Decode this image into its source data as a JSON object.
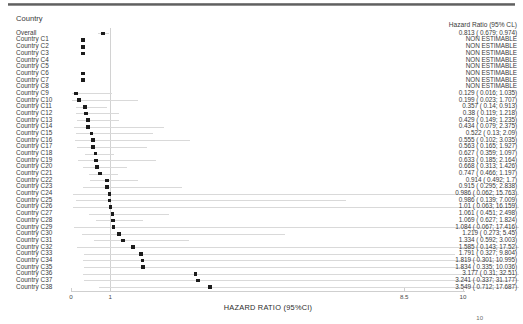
{
  "header": {
    "country_label": "Country",
    "hazard_ratio_label": "Hazard Ratio (95% CL)"
  },
  "axis": {
    "title": "HAZARD RATIO (95%CI)",
    "ticks": [
      {
        "label": "0",
        "value": 0
      },
      {
        "label": "1",
        "value": 1
      },
      {
        "label": "8.5",
        "value": 8.5
      },
      {
        "label": "10",
        "value": 10
      }
    ],
    "reference_value": 1,
    "xmin": 0,
    "xmax": 10
  },
  "page_number": "10",
  "colors": {
    "marker": "#1c1c1c",
    "ci_line": "#d9d9d9",
    "reference_line": "#d2d2d2",
    "axis": "#cfcfcf",
    "text": "#3a3a3a"
  },
  "chart_data": {
    "type": "forest",
    "title": "",
    "xlabel": "HAZARD RATIO (95%CI)",
    "ylabel": "Country",
    "xlim": [
      0,
      10
    ],
    "reference_line": 1,
    "grid": false,
    "legend": "none",
    "columns": [
      "Country",
      "Hazard Ratio (95% CL)"
    ],
    "rows": [
      {
        "label": "Overall",
        "stat": "0.813 ( 0.679; 0.974)",
        "estimate": 0.813,
        "lower": 0.679,
        "upper": 0.974,
        "estimable": true
      },
      {
        "label": "Country C1",
        "stat": "NON ESTIMABLE",
        "estimate": 0.3,
        "lower": null,
        "upper": null,
        "estimable": false
      },
      {
        "label": "Country C2",
        "stat": "NON ESTIMABLE",
        "estimate": 0.3,
        "lower": null,
        "upper": null,
        "estimable": false
      },
      {
        "label": "Country C3",
        "stat": "NON ESTIMABLE",
        "estimate": 0.3,
        "lower": null,
        "upper": null,
        "estimable": false
      },
      {
        "label": "Country C4",
        "stat": "NON ESTIMABLE",
        "estimate": null,
        "lower": null,
        "upper": null,
        "estimable": false
      },
      {
        "label": "Country C5",
        "stat": "NON ESTIMABLE",
        "estimate": null,
        "lower": null,
        "upper": null,
        "estimable": false
      },
      {
        "label": "Country C6",
        "stat": "NON ESTIMABLE",
        "estimate": 0.3,
        "lower": null,
        "upper": null,
        "estimable": false
      },
      {
        "label": "Country C7",
        "stat": "NON ESTIMABLE",
        "estimate": 0.3,
        "lower": null,
        "upper": null,
        "estimable": false
      },
      {
        "label": "Country C8",
        "stat": "NON ESTIMABLE",
        "estimate": null,
        "lower": null,
        "upper": null,
        "estimable": false
      },
      {
        "label": "Country C9",
        "stat": "0.129 ( 0.016; 1.035)",
        "estimate": 0.129,
        "lower": 0.016,
        "upper": 1.035,
        "estimable": true
      },
      {
        "label": "Country C10",
        "stat": "0.199 ( 0.023; 1.707)",
        "estimate": 0.199,
        "lower": 0.023,
        "upper": 1.707,
        "estimable": true
      },
      {
        "label": "Country C11",
        "stat": "0.357 ( 0.14; 0.913)",
        "estimate": 0.357,
        "lower": 0.14,
        "upper": 0.913,
        "estimable": true
      },
      {
        "label": "Country C12",
        "stat": "0.38 ( 0.119; 1.218)",
        "estimate": 0.38,
        "lower": 0.119,
        "upper": 1.218,
        "estimable": true
      },
      {
        "label": "Country C13",
        "stat": "0.429 ( 0.149; 1.235)",
        "estimate": 0.429,
        "lower": 0.149,
        "upper": 1.235,
        "estimable": true
      },
      {
        "label": "Country C14",
        "stat": "0.434 ( 0.079; 2.375)",
        "estimate": 0.434,
        "lower": 0.079,
        "upper": 2.375,
        "estimable": true
      },
      {
        "label": "Country C15",
        "stat": "0.522 ( 0.13; 2.09)",
        "estimate": 0.522,
        "lower": 0.13,
        "upper": 2.09,
        "estimable": true
      },
      {
        "label": "Country C16",
        "stat": "0.555 ( 0.102; 3.035)",
        "estimate": 0.555,
        "lower": 0.102,
        "upper": 3.035,
        "estimable": true
      },
      {
        "label": "Country C17",
        "stat": "0.563 ( 0.165; 1.927)",
        "estimate": 0.563,
        "lower": 0.165,
        "upper": 1.927,
        "estimable": true
      },
      {
        "label": "Country C18",
        "stat": "0.627 ( 0.359; 1.097)",
        "estimate": 0.627,
        "lower": 0.359,
        "upper": 1.097,
        "estimable": true
      },
      {
        "label": "Country C19",
        "stat": "0.633 ( 0.185; 2.164)",
        "estimate": 0.633,
        "lower": 0.185,
        "upper": 2.164,
        "estimable": true
      },
      {
        "label": "Country C20",
        "stat": "0.668 ( 0.313; 1.426)",
        "estimate": 0.668,
        "lower": 0.313,
        "upper": 1.426,
        "estimable": true
      },
      {
        "label": "Country C21",
        "stat": "0.747 ( 0.466; 1.197)",
        "estimate": 0.747,
        "lower": 0.466,
        "upper": 1.197,
        "estimable": true
      },
      {
        "label": "Country C22",
        "stat": "0.914 ( 0.492; 1.7)",
        "estimate": 0.914,
        "lower": 0.492,
        "upper": 1.7,
        "estimable": true
      },
      {
        "label": "Country C23",
        "stat": "0.915 ( 0.295; 2.838)",
        "estimate": 0.915,
        "lower": 0.295,
        "upper": 2.838,
        "estimable": true
      },
      {
        "label": "Country C24",
        "stat": "0.986 ( 0.062; 15.763)",
        "estimate": 0.986,
        "lower": 0.062,
        "upper": 15.763,
        "estimable": true
      },
      {
        "label": "Country C25",
        "stat": "0.986 ( 0.139; 7.009)",
        "estimate": 0.986,
        "lower": 0.139,
        "upper": 7.009,
        "estimable": true
      },
      {
        "label": "Country C26",
        "stat": "1.01 ( 0.063; 16.159)",
        "estimate": 1.01,
        "lower": 0.063,
        "upper": 16.159,
        "estimable": true
      },
      {
        "label": "Country C27",
        "stat": "1.061 ( 0.451; 2.498)",
        "estimate": 1.061,
        "lower": 0.451,
        "upper": 2.498,
        "estimable": true
      },
      {
        "label": "Country C28",
        "stat": "1.069 ( 0.627; 1.824)",
        "estimate": 1.069,
        "lower": 0.627,
        "upper": 1.824,
        "estimable": true
      },
      {
        "label": "Country C29",
        "stat": "1.084 ( 0.067; 17.416)",
        "estimate": 1.084,
        "lower": 0.067,
        "upper": 17.416,
        "estimable": true
      },
      {
        "label": "Country C30",
        "stat": "1.219 ( 0.273; 5.45)",
        "estimate": 1.219,
        "lower": 0.273,
        "upper": 5.45,
        "estimable": true
      },
      {
        "label": "Country C31",
        "stat": "1.334 ( 0.592; 3.003)",
        "estimate": 1.334,
        "lower": 0.592,
        "upper": 3.003,
        "estimable": true
      },
      {
        "label": "Country C32",
        "stat": "1.585 ( 0.143; 17.52)",
        "estimate": 1.585,
        "lower": 0.143,
        "upper": 17.52,
        "estimable": true
      },
      {
        "label": "Country C33",
        "stat": "1.791 ( 0.327; 9.804)",
        "estimate": 1.791,
        "lower": 0.327,
        "upper": 9.804,
        "estimable": true
      },
      {
        "label": "Country C34",
        "stat": "1.819 ( 0.301; 10.995)",
        "estimate": 1.819,
        "lower": 0.301,
        "upper": 10.995,
        "estimable": true
      },
      {
        "label": "Country C35",
        "stat": "1.834 ( 0.335; 10.036)",
        "estimate": 1.834,
        "lower": 0.335,
        "upper": 10.036,
        "estimable": true
      },
      {
        "label": "Country C36",
        "stat": "3.177 ( 0.31; 32.51)",
        "estimate": 3.177,
        "lower": 0.31,
        "upper": 32.51,
        "estimable": true
      },
      {
        "label": "Country C37",
        "stat": "3.241 ( 0.337; 31.177)",
        "estimate": 3.241,
        "lower": 0.337,
        "upper": 31.177,
        "estimable": true
      },
      {
        "label": "Country C38",
        "stat": "3.549 ( 0.712; 17.687)",
        "estimate": 3.549,
        "lower": 0.712,
        "upper": 17.687,
        "estimable": true
      }
    ]
  }
}
